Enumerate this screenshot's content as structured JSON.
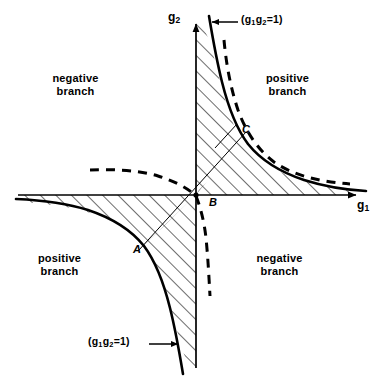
{
  "figure": {
    "type": "diagram",
    "axes": {
      "x_label": "g",
      "x_label_sub": "1",
      "y_label": "g",
      "y_label_sub": "2",
      "origin_px": [
        196,
        195
      ],
      "x_arrow_end_px": [
        360,
        195
      ],
      "y_arrow_end_px": [
        196,
        18
      ]
    },
    "curves": [
      {
        "name": "hyperbola-solid-quadrant-1",
        "style": "solid",
        "equation": "g1 g2 = 1",
        "quadrant": 1
      },
      {
        "name": "hyperbola-solid-quadrant-3",
        "style": "solid",
        "equation": "g1 g2 = 1",
        "quadrant": 3
      },
      {
        "name": "hyperbola-dashed-quadrant-1",
        "style": "dashed",
        "quadrant": 1
      },
      {
        "name": "hyperbola-dashed-quadrant-2",
        "style": "dashed",
        "quadrant": 2
      },
      {
        "name": "hyperbola-dashed-quadrant-4",
        "style": "dashed",
        "quadrant": 4
      }
    ],
    "region_labels": [
      {
        "id": "upper-left",
        "line1": "negative",
        "line2": "branch",
        "quadrant": 2,
        "x": 52,
        "y": 75
      },
      {
        "id": "upper-right",
        "line1": "positive",
        "line2": "branch",
        "quadrant": 1,
        "x": 262,
        "y": 75
      },
      {
        "id": "lower-left",
        "line1": "positive",
        "line2": "branch",
        "quadrant": 3,
        "x": 38,
        "y": 255
      },
      {
        "id": "lower-right",
        "line1": "negative",
        "line2": "branch",
        "quadrant": 4,
        "x": 252,
        "y": 255
      }
    ],
    "point_labels": [
      {
        "id": "A",
        "text": "A",
        "x": 134,
        "y": 245
      },
      {
        "id": "B",
        "text": "B",
        "x": 210,
        "y": 198
      },
      {
        "id": "C",
        "text": "C",
        "x": 243,
        "y": 126
      }
    ],
    "annotations": [
      {
        "id": "top-equation",
        "prefix": "(",
        "g_letter": "g",
        "sub1": "1",
        "g_letter2": "g",
        "sub2": "2",
        "equals": "=1)",
        "text": "(g1g2=1)",
        "x": 242,
        "y": 14,
        "arrow": {
          "from": [
            240,
            22
          ],
          "to": [
            212,
            22
          ],
          "direction": "left"
        }
      },
      {
        "id": "bottom-equation",
        "prefix": "(",
        "g_letter": "g",
        "sub1": "1",
        "g_letter2": "g",
        "sub2": "2",
        "equals": "=1)",
        "text": "(g1g2=1)",
        "x": 92,
        "y": 336,
        "arrow": {
          "from": [
            150,
            344
          ],
          "to": [
            180,
            344
          ],
          "direction": "right"
        }
      }
    ],
    "colors": {
      "stroke": "#000000",
      "background": "#ffffff",
      "hatch": "#000000"
    },
    "hatching": {
      "enabled": true,
      "pattern": "diagonal-lines",
      "regions": [
        "quadrant-1-between-axes-and-hyperbola",
        "quadrant-3-between-axes-and-hyperbola"
      ]
    }
  }
}
